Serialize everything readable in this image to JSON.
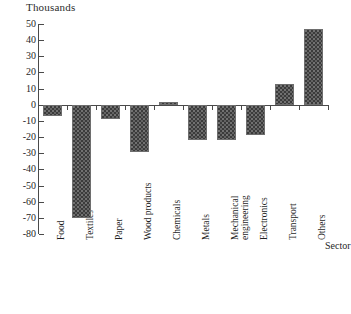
{
  "chart_data": {
    "type": "bar",
    "title": "",
    "unit_label": "Thousands",
    "xlabel": "Sector",
    "ylabel": "",
    "categories": [
      "Food",
      "Textiles",
      "Paper",
      "Wood products",
      "Chemicals",
      "Metals",
      "Mechanical\nengineering",
      "Electronics",
      "Transport",
      "Others"
    ],
    "values": [
      -7,
      -70,
      -9,
      -29,
      2,
      -22,
      -22,
      -19,
      13,
      47
    ],
    "ylim": [
      -80,
      50
    ],
    "yticks": [
      50,
      40,
      30,
      20,
      10,
      0,
      -10,
      -20,
      -30,
      -40,
      -50,
      -60,
      -70,
      -80
    ],
    "ytick_labels": [
      "50",
      "40",
      "30",
      "20",
      "10",
      "0",
      "-10",
      "-20",
      "-30",
      "-40",
      "-50",
      "-60",
      "-70",
      "-80"
    ],
    "grid": false,
    "legend": false,
    "bar_color": "#3b3b3b",
    "bar_edge_color": "#6e6e6e",
    "axis_color": "#4a4a4a"
  }
}
